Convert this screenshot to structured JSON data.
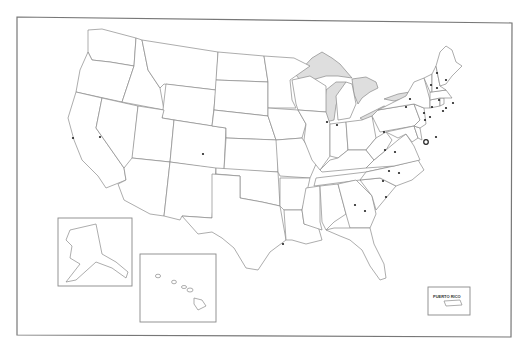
{
  "map": {
    "title": "United States outline map",
    "insets": [
      {
        "name": "Alaska"
      },
      {
        "name": "Hawaii"
      },
      {
        "name": "Puerto Rico",
        "label": "PUERTO RICO"
      }
    ],
    "lake_color": "#dedede",
    "border_color": "#8a8a8a",
    "capital_marker": {
      "state": "Virginia",
      "x": 426,
      "y": 142
    },
    "dots": [
      {
        "x": 100,
        "y": 137
      },
      {
        "x": 73,
        "y": 138
      },
      {
        "x": 203,
        "y": 154
      },
      {
        "x": 283,
        "y": 244
      },
      {
        "x": 327,
        "y": 122
      },
      {
        "x": 337,
        "y": 125
      },
      {
        "x": 355,
        "y": 205
      },
      {
        "x": 365,
        "y": 211
      },
      {
        "x": 383,
        "y": 181
      },
      {
        "x": 386,
        "y": 197
      },
      {
        "x": 389,
        "y": 171
      },
      {
        "x": 399,
        "y": 173
      },
      {
        "x": 385,
        "y": 150
      },
      {
        "x": 395,
        "y": 152
      },
      {
        "x": 384,
        "y": 132
      },
      {
        "x": 406,
        "y": 107
      },
      {
        "x": 410,
        "y": 99
      },
      {
        "x": 425,
        "y": 120
      },
      {
        "x": 430,
        "y": 117
      },
      {
        "x": 436,
        "y": 137
      },
      {
        "x": 439,
        "y": 100
      },
      {
        "x": 431,
        "y": 85
      },
      {
        "x": 432,
        "y": 107
      },
      {
        "x": 437,
        "y": 88
      },
      {
        "x": 443,
        "y": 111
      },
      {
        "x": 446,
        "y": 108
      },
      {
        "x": 437,
        "y": 73
      },
      {
        "x": 446,
        "y": 80
      },
      {
        "x": 424,
        "y": 113
      },
      {
        "x": 453,
        "y": 103
      }
    ]
  }
}
